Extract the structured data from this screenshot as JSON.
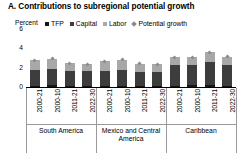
{
  "chart_data": {
    "type": "bar",
    "title": "A. Contributions to subregional potential growth",
    "subtitle": "",
    "unit_label": "Percent",
    "xlabel": "",
    "ylabel": "Percent",
    "ylim": [
      0,
      6
    ],
    "yticks": [
      0,
      2,
      4,
      6
    ],
    "ytick_labels": [
      "0",
      "2",
      "4",
      "6"
    ],
    "grid": false,
    "stacked": true,
    "legend_position": "top",
    "legend": [
      "TFP",
      "Capital",
      "Labor",
      "Potential growth"
    ],
    "colors": {
      "tfp": "#161616",
      "capital": "#3d3d3d",
      "labor": "#a8a8a8",
      "potential_growth": "#8c8c8c",
      "axis": "#000000",
      "separator": "#9a9a9a",
      "background": "#ffffff"
    },
    "categories": [
      "2000-21",
      "2000-10",
      "2011-21",
      "2022-30",
      "2000-21",
      "2000-10",
      "2011-21",
      "2022-30",
      "2000-21",
      "2000-10",
      "2011-21",
      "2022-30"
    ],
    "groups": [
      {
        "name": "South America",
        "bars": [
          {
            "period": "2000-21",
            "tfp": 0.15,
            "capital": 1.65,
            "labor": 0.95,
            "total": 2.75,
            "potential_growth": 2.75
          },
          {
            "period": "2000-10",
            "tfp": 0.2,
            "capital": 1.7,
            "labor": 1.05,
            "total": 2.95,
            "potential_growth": 2.95
          },
          {
            "period": "2011-21",
            "tfp": 0.1,
            "capital": 1.55,
            "labor": 0.8,
            "total": 2.45,
            "potential_growth": 2.45
          },
          {
            "period": "2022-30",
            "tfp": 0.12,
            "capital": 1.5,
            "labor": 0.75,
            "total": 2.37,
            "potential_growth": 2.37
          }
        ]
      },
      {
        "name": "Mexico and Central America",
        "bars": [
          {
            "period": "2000-21",
            "tfp": 0.1,
            "capital": 1.6,
            "labor": 0.95,
            "total": 2.65,
            "potential_growth": 2.65
          },
          {
            "period": "2000-10",
            "tfp": 0.12,
            "capital": 1.68,
            "labor": 1.0,
            "total": 2.8,
            "potential_growth": 2.8
          },
          {
            "period": "2011-21",
            "tfp": 0.08,
            "capital": 1.5,
            "labor": 0.82,
            "total": 2.4,
            "potential_growth": 2.4
          },
          {
            "period": "2022-30",
            "tfp": 0.1,
            "capital": 1.45,
            "labor": 0.8,
            "total": 2.35,
            "potential_growth": 2.35
          }
        ]
      },
      {
        "name": "Caribbean",
        "bars": [
          {
            "period": "2000-21",
            "tfp": 0.15,
            "capital": 2.1,
            "labor": 0.85,
            "total": 3.1,
            "potential_growth": 3.1
          },
          {
            "period": "2000-10",
            "tfp": 0.18,
            "capital": 2.05,
            "labor": 0.87,
            "total": 3.1,
            "potential_growth": 3.1
          },
          {
            "period": "2011-21",
            "tfp": 0.2,
            "capital": 2.4,
            "labor": 1.0,
            "total": 3.6,
            "potential_growth": 3.6
          },
          {
            "period": "2022-30",
            "tfp": 0.15,
            "capital": 2.15,
            "labor": 0.85,
            "total": 3.15,
            "potential_growth": 3.15
          }
        ]
      }
    ]
  }
}
